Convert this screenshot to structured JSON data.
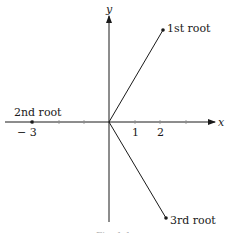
{
  "diagram": {
    "type": "complex-plane-roots",
    "axes": {
      "x_label": "x",
      "y_label": "y",
      "x_ticks": [
        {
          "value": -3,
          "label": "− 3"
        },
        {
          "value": -2,
          "label": ""
        },
        {
          "value": -1,
          "label": ""
        },
        {
          "value": 1,
          "label": "1"
        },
        {
          "value": 2,
          "label": "2"
        },
        {
          "value": 3,
          "label": ""
        }
      ]
    },
    "points": [
      {
        "name": "1st root",
        "label": "1st root",
        "x": 2.1,
        "y": 3.6
      },
      {
        "name": "2nd root",
        "label": "2nd root",
        "x": -3,
        "y": 0
      },
      {
        "name": "3rd root",
        "label": "3rd root",
        "x": 2.2,
        "y": -3.8
      }
    ],
    "caption": "Fig. 1.1"
  },
  "colors": {
    "ink": "#1a1a1a",
    "background": "#ffffff"
  }
}
